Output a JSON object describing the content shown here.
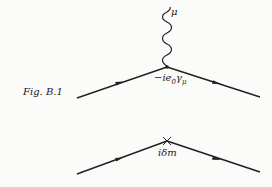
{
  "figure": {
    "caption": "Fig. B.1",
    "diagrams": [
      {
        "type": "vertex",
        "boson_index": "μ",
        "vertex_label": "−ie₀γμ",
        "vertex_label_main": "−ie",
        "vertex_label_sub": "0",
        "vertex_label_gamma": "γ",
        "vertex_label_gamma_sub": "μ"
      },
      {
        "type": "mass-counterterm",
        "vertex_label": "iδm"
      }
    ]
  },
  "colors": {
    "ink": "#222222",
    "paper": "#fbfbf9"
  }
}
